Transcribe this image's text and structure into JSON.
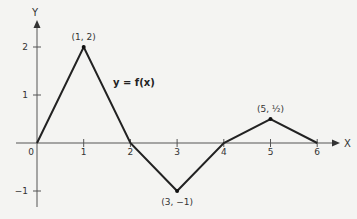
{
  "chart_data": {
    "type": "line",
    "title": "",
    "function_label": "y = f(x)",
    "xlabel": "X",
    "ylabel": "Y",
    "x": [
      0,
      1,
      2,
      3,
      4,
      5,
      6
    ],
    "series": [
      {
        "name": "y = f(x)",
        "values": [
          0,
          2,
          0,
          -1,
          0,
          0.5,
          0
        ]
      }
    ],
    "x_ticks": [
      "0",
      "1",
      "2",
      "3",
      "4",
      "5",
      "6"
    ],
    "y_ticks": [
      "-1",
      "1",
      "2"
    ],
    "annotations": [
      {
        "point": [
          1,
          2
        ],
        "text": "(1, 2)"
      },
      {
        "point": [
          3,
          -1
        ],
        "text": "(3, −1)"
      },
      {
        "point": [
          5,
          0.5
        ],
        "text": "(5, ½)"
      }
    ],
    "xlim": [
      0,
      6.5
    ],
    "ylim": [
      -1.3,
      2.6
    ],
    "grid": false,
    "legend": "none"
  }
}
